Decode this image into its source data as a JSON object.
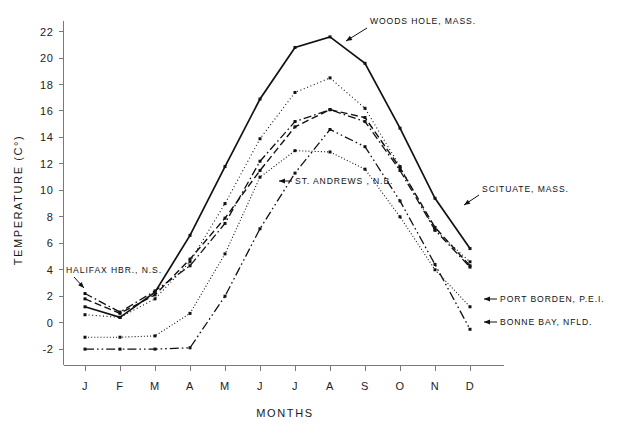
{
  "chart_data": {
    "type": "line",
    "title": "",
    "xlabel": "MONTHS",
    "ylabel": "TEMPERATURE (C°)",
    "categories": [
      "J",
      "F",
      "M",
      "A",
      "M",
      "J",
      "J",
      "A",
      "S",
      "O",
      "N",
      "D"
    ],
    "x_tick_labels": [
      "J",
      "F",
      "M",
      "A",
      "M",
      "J",
      "J",
      "A",
      "S",
      "O",
      "N",
      "D"
    ],
    "y_tick_labels": [
      "-2",
      "0",
      "2",
      "4",
      "6",
      "8",
      "10",
      "12",
      "14",
      "16",
      "18",
      "20",
      "22"
    ],
    "ylim": [
      -3.2,
      22.8
    ],
    "xlim": [
      0,
      13
    ],
    "y_tick_values": [
      -2,
      0,
      2,
      4,
      6,
      8,
      10,
      12,
      14,
      16,
      18,
      20,
      22
    ],
    "grid": false,
    "legend": "inline-annotations",
    "units": "degrees Celsius",
    "series": [
      {
        "name": "WOODS HOLE, MASS.",
        "style": "solid",
        "values": [
          1.2,
          0.4,
          2.3,
          6.6,
          11.8,
          16.9,
          20.8,
          21.6,
          19.6,
          14.7,
          9.4,
          5.6
        ]
      },
      {
        "name": "SCITUATE, MASS.",
        "style": "dotted",
        "values": [
          0.6,
          0.4,
          1.8,
          4.6,
          9.0,
          13.9,
          17.4,
          18.5,
          16.2,
          11.8,
          7.0,
          4.6
        ]
      },
      {
        "name": "ST. ANDREWS , N.B.",
        "style": "dashed",
        "values": [
          1.8,
          0.7,
          2.1,
          4.8,
          7.9,
          11.5,
          14.8,
          16.1,
          15.5,
          11.7,
          7.2,
          4.3
        ]
      },
      {
        "name": "HALIFAX HBR., N.S.",
        "style": "dash-dot",
        "values": [
          2.2,
          0.8,
          2.4,
          4.3,
          7.5,
          12.2,
          15.2,
          16.1,
          15.2,
          11.5,
          7.0,
          4.2
        ]
      },
      {
        "name": "PORT BORDEN, P.E.I.",
        "style": "fine-dotted",
        "values": [
          -1.1,
          -1.1,
          -1.0,
          0.7,
          5.2,
          11.0,
          13.0,
          12.9,
          11.6,
          8.0,
          4.0,
          1.2
        ]
      },
      {
        "name": "BONNE BAY, NFLD.",
        "style": "dash-dot-dot",
        "values": [
          -2.0,
          -2.0,
          -2.0,
          -1.9,
          2.0,
          7.1,
          11.3,
          14.6,
          13.3,
          9.2,
          4.4,
          -0.5
        ]
      }
    ],
    "annotations": [
      {
        "label": "WOODS HOLE, MASS.",
        "series": "WOODS HOLE, MASS."
      },
      {
        "label": "SCITUATE, MASS.",
        "series": "SCITUATE, MASS."
      },
      {
        "label": "ST. ANDREWS , N.B.",
        "series": "ST. ANDREWS , N.B."
      },
      {
        "label": "HALIFAX HBR., N.S.",
        "series": "HALIFAX HBR., N.S."
      },
      {
        "label": "PORT BORDEN, P.E.I.",
        "series": "PORT BORDEN, P.E.I."
      },
      {
        "label": "BONNE BAY, NFLD.",
        "series": "BONNE BAY, NFLD."
      }
    ]
  },
  "colors": {
    "ink": "#111111",
    "axis": "#7a7a7a",
    "background": "#ffffff"
  }
}
